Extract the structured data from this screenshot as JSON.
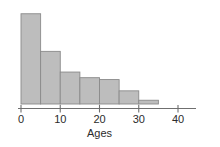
{
  "chart_data": {
    "type": "bar",
    "title": "",
    "subtitle": "",
    "xlabel": "Ages",
    "ylabel": "",
    "xlim": [
      0,
      40
    ],
    "ylim": [
      0,
      25
    ],
    "grid": false,
    "legend": null,
    "orientation": "vertical",
    "bin_width": 5,
    "bin_edges": [
      0,
      5,
      10,
      15,
      20,
      25,
      30,
      35
    ],
    "categories": [
      "0-5",
      "5-10",
      "10-15",
      "15-20",
      "20-25",
      "25-30",
      "30-35"
    ],
    "values": [
      24,
      14,
      8.5,
      7,
      6.5,
      3.5,
      1
    ],
    "xticks": [
      0,
      10,
      20,
      30,
      40
    ],
    "xtick_labels": [
      "0",
      "10",
      "20",
      "30",
      "40"
    ],
    "yticks": [],
    "ytick_labels": [],
    "colors": {
      "bar_fill": "#bdbdbd",
      "bar_stroke": "#8a8a8a",
      "axis": "#6f6f6f",
      "text": "#2b2b2b",
      "background": "#ffffff"
    }
  }
}
